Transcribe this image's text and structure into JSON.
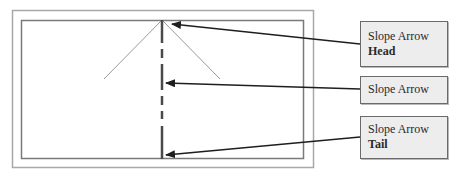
{
  "diagram": {
    "colors": {
      "outer_frame": "#a8a8a8",
      "inner_frame": "#7a7a7a",
      "arrow_head_lines": "#9a9a9a",
      "arrow_shaft": "#4a4a4a",
      "pointer": "#1e1e1e",
      "callout_fill": "#ededed",
      "callout_border": "#6a6a6a"
    },
    "callouts": [
      {
        "id": "head",
        "line1": "Slope Arrow",
        "line2": "Head"
      },
      {
        "id": "body",
        "line1": "Slope Arrow",
        "line2": ""
      },
      {
        "id": "tail",
        "line1": "Slope Arrow",
        "line2": "Tail"
      }
    ]
  }
}
